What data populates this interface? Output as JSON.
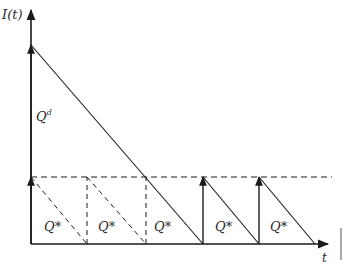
{
  "diagram": {
    "y_axis_label": "I(t)",
    "x_axis_label": "t",
    "initial_order_label": "Q",
    "initial_order_superscript": "d",
    "cycle_label": "Q*",
    "colors": {
      "line": "#1a1a1a",
      "text": "#2a2a2a",
      "background": "#ffffff"
    },
    "cycles": [
      {
        "label": "Q*",
        "style": "dashed"
      },
      {
        "label": "Q*",
        "style": "dashed"
      },
      {
        "label": "Q*",
        "style": "dashed"
      },
      {
        "label": "Q*",
        "style": "solid"
      },
      {
        "label": "Q*",
        "style": "solid"
      }
    ]
  }
}
